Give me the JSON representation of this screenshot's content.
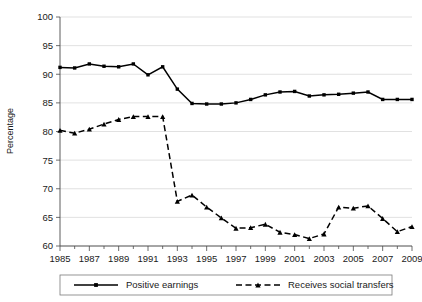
{
  "chart_data": {
    "type": "line",
    "title": "",
    "xlabel": "",
    "ylabel": "Percentage",
    "ylim": [
      60,
      100
    ],
    "ytick_step": 5,
    "yticks": [
      60,
      65,
      70,
      75,
      80,
      85,
      90,
      95,
      100
    ],
    "grid": true,
    "legend_position": "bottom",
    "x": [
      1985,
      1986,
      1987,
      1988,
      1989,
      1990,
      1991,
      1992,
      1993,
      1994,
      1995,
      1996,
      1997,
      1998,
      1999,
      2000,
      2001,
      2002,
      2003,
      2004,
      2005,
      2006,
      2007,
      2008,
      2009
    ],
    "xtick_labels": [
      "1985",
      "1987",
      "1989",
      "1991",
      "1993",
      "1995",
      "1997",
      "1999",
      "2001",
      "2003",
      "2005",
      "2007",
      "2009"
    ],
    "xtick_values": [
      1985,
      1987,
      1989,
      1991,
      1993,
      1995,
      1997,
      1999,
      2001,
      2003,
      2005,
      2007,
      2009
    ],
    "series": [
      {
        "name": "Positive earnings",
        "style": "solid",
        "marker": "square",
        "color": "#000000",
        "values": [
          91.2,
          91.1,
          91.8,
          91.4,
          91.3,
          91.8,
          89.9,
          91.3,
          87.4,
          84.9,
          84.8,
          84.8,
          85.0,
          85.6,
          86.4,
          86.9,
          87.0,
          86.2,
          86.4,
          86.5,
          86.7,
          86.9,
          85.6,
          85.6,
          85.6
        ]
      },
      {
        "name": "Receives social transfers",
        "style": "dashed",
        "marker": "triangle",
        "color": "#000000",
        "values": [
          80.2,
          79.7,
          80.4,
          81.3,
          82.1,
          82.6,
          82.6,
          82.6,
          67.8,
          68.9,
          66.8,
          64.9,
          63.1,
          63.2,
          63.8,
          62.4,
          62.0,
          61.3,
          62.1,
          66.8,
          66.6,
          67.0,
          64.8,
          62.5,
          63.4
        ]
      }
    ]
  },
  "axis": {
    "ylabel": "Percentage"
  },
  "legend": {
    "entries": [
      {
        "label": "Positive earnings"
      },
      {
        "label": "Receives social transfers"
      }
    ]
  }
}
